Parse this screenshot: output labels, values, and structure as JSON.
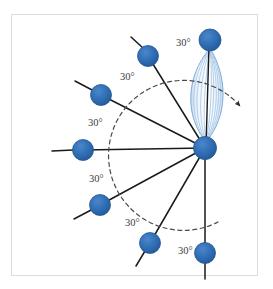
{
  "figure": {
    "frame": {
      "x": 11,
      "y": 14,
      "width": 247,
      "height": 262,
      "border_color": "#dcdcdc"
    },
    "colors": {
      "node_fill": "#2e6db4",
      "node_stroke": "#24578f",
      "bond_line": "#1a1a1a",
      "arc_dashed": "#4a4a4a",
      "lens_light": "#eaf2fb",
      "lens_stripe": "#a8c8e8",
      "lens_edge": "#7fa9d6",
      "label_text": "#3b3b3b",
      "background": "#ffffff"
    },
    "hub": {
      "label": "central-atom",
      "cx": 205,
      "cy": 148,
      "r": 11.5
    },
    "nodes": [
      {
        "id": "node-top",
        "cx": 210,
        "cy": 40,
        "r": 11,
        "angle_deg": 90,
        "tail": false
      },
      {
        "id": "node-upper-left",
        "cx": 148,
        "cy": 56,
        "r": 10.5,
        "angle_deg": 60,
        "tail": true
      },
      {
        "id": "node-left-upper",
        "cx": 101,
        "cy": 95,
        "r": 10.5,
        "angle_deg": 30,
        "tail": true
      },
      {
        "id": "node-left",
        "cx": 83,
        "cy": 150,
        "r": 10.5,
        "angle_deg": 0,
        "tail": false
      },
      {
        "id": "node-left-lower",
        "cx": 100,
        "cy": 205,
        "r": 10.5,
        "angle_deg": -30,
        "tail": true
      },
      {
        "id": "node-lower-left",
        "cx": 150,
        "cy": 243,
        "r": 10.5,
        "angle_deg": -60,
        "tail": true
      },
      {
        "id": "node-bottom",
        "cx": 205,
        "cy": 253,
        "r": 10.5,
        "angle_deg": -90,
        "tail": true
      }
    ],
    "lens": {
      "id": "orbital-lens",
      "top_x": 210,
      "top_y": 48,
      "bottom_x": 206,
      "bottom_y": 142,
      "half_width": 19,
      "stripe_count": 9
    },
    "rotation_arc": {
      "id": "rotation-arrow",
      "radius": 75,
      "start_deg": -80,
      "end_deg": 62,
      "dashed": true,
      "arrowhead_at": "end"
    },
    "angle_labels": [
      {
        "id": "angle-label-1",
        "text": "30°",
        "x": 176,
        "y": 46
      },
      {
        "id": "angle-label-2",
        "text": "30°",
        "x": 120,
        "y": 80
      },
      {
        "id": "angle-label-3",
        "text": "30°",
        "x": 88,
        "y": 126
      },
      {
        "id": "angle-label-4",
        "text": "30°",
        "x": 89,
        "y": 182
      },
      {
        "id": "angle-label-5",
        "text": "30°",
        "x": 125,
        "y": 226
      },
      {
        "id": "angle-label-6",
        "text": "30°",
        "x": 178,
        "y": 254
      }
    ]
  }
}
